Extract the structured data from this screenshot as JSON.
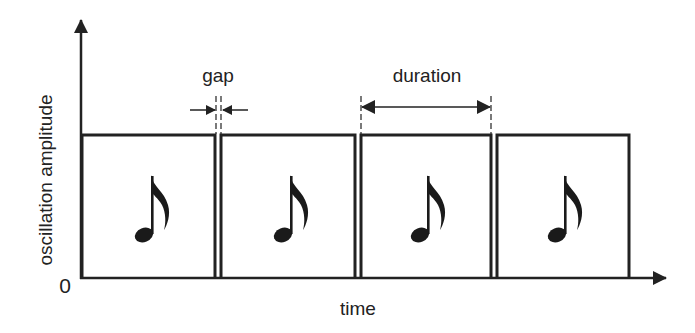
{
  "diagram": {
    "y_axis_label": "oscillation amplitude",
    "x_axis_label": "time",
    "origin_label": "0",
    "gap_label": "gap",
    "duration_label": "duration",
    "note_count": 4,
    "note_glyph": "eighth-note",
    "line_color": "#222222",
    "background": "#ffffff"
  }
}
